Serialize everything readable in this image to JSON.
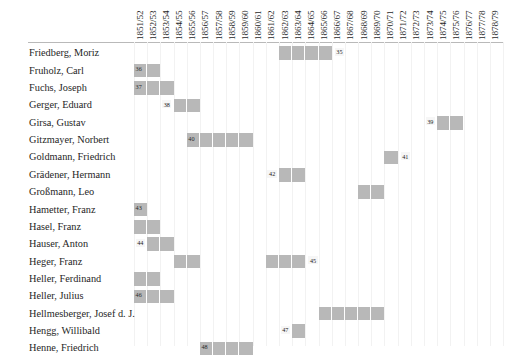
{
  "chart_data": {
    "type": "table",
    "title": "",
    "xlabel": "",
    "ylabel": "",
    "grid": true,
    "legend": "none",
    "columns": [
      "1851/52",
      "1852/53",
      "1853/54",
      "1854/55",
      "1855/56",
      "1856/57",
      "1857/58",
      "1858/59",
      "1859/60",
      "1860/61",
      "1861/62",
      "1862/63",
      "1863/64",
      "1864/65",
      "1865/66",
      "1866/67",
      "1867/68",
      "1868/69",
      "1869/70",
      "1870/71",
      "1871/72",
      "1872/73",
      "1873/74",
      "1874/75",
      "1875/76",
      "1876/77",
      "1877/78",
      "1878/79"
    ],
    "rows": [
      {
        "name": "Friedberg, Moriz",
        "bars": [
          {
            "start": 11,
            "span": 4,
            "note": "35",
            "note_side": "right"
          }
        ]
      },
      {
        "name": "Fruholz, Carl",
        "bars": [
          {
            "start": 0,
            "span": 2,
            "note": "36",
            "note_side": "inside"
          }
        ]
      },
      {
        "name": "Fuchs, Joseph",
        "bars": [
          {
            "start": 0,
            "span": 3,
            "note": "37",
            "note_side": "inside"
          }
        ]
      },
      {
        "name": "Gerger, Eduard",
        "bars": [
          {
            "start": 3,
            "span": 2,
            "note": "38",
            "note_side": "left"
          }
        ]
      },
      {
        "name": "Girsa, Gustav",
        "bars": [
          {
            "start": 23,
            "span": 2,
            "note": "39",
            "note_side": "left"
          }
        ]
      },
      {
        "name": "Gitzmayer, Norbert",
        "bars": [
          {
            "start": 4,
            "span": 5,
            "note": "40",
            "note_side": "inside"
          }
        ]
      },
      {
        "name": "Goldmann, Friedrich",
        "bars": [
          {
            "start": 19,
            "span": 1,
            "note": "41",
            "note_side": "right"
          }
        ]
      },
      {
        "name": "Grädener, Hermann",
        "bars": [
          {
            "start": 11,
            "span": 2,
            "note": "42",
            "note_side": "left"
          }
        ]
      },
      {
        "name": "Großmann, Leo",
        "bars": [
          {
            "start": 17,
            "span": 2,
            "note": "",
            "note_side": "none"
          }
        ]
      },
      {
        "name": "Hametter, Franz",
        "bars": [
          {
            "start": 0,
            "span": 1,
            "note": "43",
            "note_side": "inside"
          }
        ]
      },
      {
        "name": "Hasel, Franz",
        "bars": [
          {
            "start": 0,
            "span": 2,
            "note": "",
            "note_side": "none"
          }
        ]
      },
      {
        "name": "Hauser, Anton",
        "bars": [
          {
            "start": 1,
            "span": 2,
            "note": "44",
            "note_side": "left"
          }
        ]
      },
      {
        "name": "Heger, Franz",
        "bars": [
          {
            "start": 3,
            "span": 2,
            "note": "",
            "note_side": "none"
          },
          {
            "start": 10,
            "span": 3,
            "note": "45",
            "note_side": "right"
          }
        ]
      },
      {
        "name": "Heller, Ferdinand",
        "bars": [
          {
            "start": 0,
            "span": 2,
            "note": "",
            "note_side": "none"
          }
        ]
      },
      {
        "name": "Heller, Julius",
        "bars": [
          {
            "start": 0,
            "span": 3,
            "note": "46",
            "note_side": "inside"
          }
        ]
      },
      {
        "name": "Hellmesberger, Josef d. J.",
        "bars": [
          {
            "start": 14,
            "span": 5,
            "note": "",
            "note_side": "none"
          }
        ]
      },
      {
        "name": "Hengg, Willibald",
        "bars": [
          {
            "start": 12,
            "span": 1,
            "note": "47",
            "note_side": "left"
          }
        ]
      },
      {
        "name": "Henne, Friedrich",
        "bars": [
          {
            "start": 5,
            "span": 4,
            "note": "48",
            "note_side": "inside"
          }
        ]
      }
    ]
  },
  "style": {
    "bar_color": "#b8b8b8",
    "grid_color": "#f2f2f2",
    "rule_color": "#b9b9b9",
    "text_color": "#262626",
    "background": "#ffffff"
  }
}
